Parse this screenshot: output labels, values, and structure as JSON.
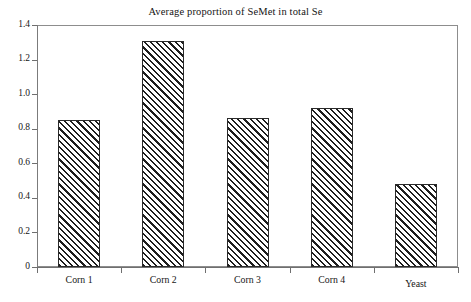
{
  "chart_data": {
    "type": "bar",
    "title": "Average proportion of SeMet in total Se",
    "xlabel": "",
    "ylabel": "",
    "categories": [
      "Corn 1",
      "Corn 2",
      "Corn 3",
      "Corn 4",
      "Yeast"
    ],
    "values": [
      0.85,
      1.31,
      0.86,
      0.92,
      0.48
    ],
    "ylim": [
      0,
      1.4
    ],
    "yticks": [
      "0",
      "0.2",
      "0.4",
      "0.6",
      "0.8",
      "1.0",
      "1.2",
      "1.4"
    ],
    "ytick_values": [
      0,
      0.2,
      0.4,
      0.6,
      0.8,
      1.0,
      1.2,
      1.4
    ],
    "grid": false,
    "legend": null,
    "bar_style": {
      "fill": "diagonal-hatch",
      "hatch_color": "#1e1e1e",
      "face_color": "#ffffff",
      "edge_color": "#2a2a2a"
    },
    "frame": {
      "box": true,
      "axis_color": "#7b7b7b"
    }
  }
}
